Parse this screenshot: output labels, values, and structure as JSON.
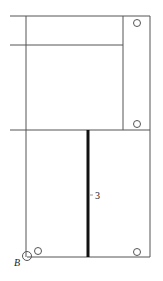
{
  "diagram": {
    "labels": {
      "member": "3",
      "support_point": "B"
    },
    "colors": {
      "line": "#555555",
      "thick_member": "#111111",
      "background": "#ffffff"
    }
  }
}
